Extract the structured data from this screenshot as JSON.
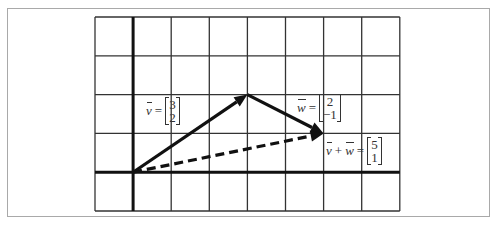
{
  "diagram": {
    "grid": {
      "cols": 8,
      "rows": 5,
      "origin_col": 1,
      "origin_row": 4
    },
    "colors": {
      "grid": "#333333",
      "axis": "#111111",
      "arrow": "#111111",
      "frame": "#a9a9a9"
    },
    "vectors": [
      {
        "id": "v",
        "from": [
          0,
          0
        ],
        "to": [
          3,
          2
        ],
        "style": "solid"
      },
      {
        "id": "w",
        "from": [
          3,
          2
        ],
        "to": [
          5,
          1
        ],
        "style": "solid"
      },
      {
        "id": "sum",
        "from": [
          0,
          0
        ],
        "to": [
          5,
          1
        ],
        "style": "dashed"
      }
    ],
    "labels": {
      "v": {
        "name": "v",
        "eq": "=",
        "top": "3",
        "bottom": "2"
      },
      "w": {
        "name": "w",
        "eq": "=",
        "top": "2",
        "bottom": "−1"
      },
      "sum": {
        "name1": "v",
        "plus": "+",
        "name2": "w",
        "eq": "=",
        "top": "5",
        "bottom": "1"
      }
    }
  }
}
